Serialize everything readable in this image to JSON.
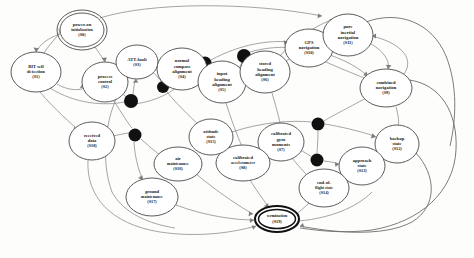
{
  "diagram": {
    "type": "state-transition-diagram",
    "title": "",
    "background_color": "#fdfdfc",
    "node_fill": "#ffffff",
    "node_stroke": "#4a4a4a",
    "edge_color": "#8e8e8e",
    "junction_color": "#111111",
    "nodes": [
      {
        "key": "s0",
        "id": "(S0)",
        "lines": [
          "power-on",
          "initialization"
        ],
        "cx": 82,
        "cy": 30,
        "rx": 25,
        "ry": 20,
        "shape": "double-ellipse"
      },
      {
        "key": "s1",
        "id": "(S1)",
        "lines": [
          "BIT self",
          "detection"
        ],
        "cx": 36,
        "cy": 72,
        "rx": 25,
        "ry": 20,
        "shape": "ellipse"
      },
      {
        "key": "s2",
        "id": "(S2)",
        "lines": [
          "process",
          "control"
        ],
        "cx": 105,
        "cy": 82,
        "rx": 23,
        "ry": 20,
        "shape": "ellipse"
      },
      {
        "key": "s3",
        "id": "(S3)",
        "lines": [
          "ATT-fault"
        ],
        "cx": 137,
        "cy": 62,
        "rx": 21,
        "ry": 17,
        "shape": "ellipse"
      },
      {
        "key": "s4",
        "id": "(S4)",
        "lines": [
          "normal",
          "compass",
          "alignment"
        ],
        "cx": 182,
        "cy": 69,
        "rx": 25,
        "ry": 21,
        "shape": "ellipse"
      },
      {
        "key": "s5",
        "id": "(S5)",
        "lines": [
          "input",
          "heading",
          "alignment"
        ],
        "cx": 222,
        "cy": 82,
        "rx": 24,
        "ry": 21,
        "shape": "ellipse"
      },
      {
        "key": "s6",
        "id": "(S6)",
        "lines": [
          "stored",
          "heading",
          "alignment"
        ],
        "cx": 265,
        "cy": 72,
        "rx": 25,
        "ry": 21,
        "shape": "ellipse"
      },
      {
        "key": "s10",
        "id": "(S10)",
        "lines": [
          "GPS",
          "navigation"
        ],
        "cx": 309,
        "cy": 48,
        "rx": 24,
        "ry": 19,
        "shape": "ellipse"
      },
      {
        "key": "s11",
        "id": "(S11)",
        "lines": [
          "pure",
          "inertial",
          "navigation"
        ],
        "cx": 348,
        "cy": 35,
        "rx": 25,
        "ry": 21,
        "shape": "ellipse"
      },
      {
        "key": "s9",
        "id": "(S9)",
        "lines": [
          "combined",
          "navigation"
        ],
        "cx": 386,
        "cy": 88,
        "rx": 26,
        "ry": 19,
        "shape": "ellipse"
      },
      {
        "key": "s12",
        "id": "(S12)",
        "lines": [
          "backup",
          "state"
        ],
        "cx": 397,
        "cy": 144,
        "rx": 22,
        "ry": 19,
        "shape": "ellipse"
      },
      {
        "key": "s13",
        "id": "(S13)",
        "lines": [
          "approach",
          "state"
        ],
        "cx": 362,
        "cy": 166,
        "rx": 23,
        "ry": 19,
        "shape": "ellipse"
      },
      {
        "key": "s14",
        "id": "(S14)",
        "lines": [
          "end-of-",
          "flight state"
        ],
        "cx": 324,
        "cy": 188,
        "rx": 25,
        "ry": 19,
        "shape": "ellipse"
      },
      {
        "key": "s7",
        "id": "(S7)",
        "lines": [
          "calibrated",
          "gyro",
          "moments"
        ],
        "cx": 281,
        "cy": 142,
        "rx": 23,
        "ry": 19,
        "shape": "ellipse"
      },
      {
        "key": "s8",
        "id": "(S8)",
        "lines": [
          "calibrated",
          "accelerometer"
        ],
        "cx": 243,
        "cy": 163,
        "rx": 27,
        "ry": 18,
        "shape": "ellipse"
      },
      {
        "key": "s15",
        "id": "(S15)",
        "lines": [
          "attitude",
          "state"
        ],
        "cx": 211,
        "cy": 137,
        "rx": 22,
        "ry": 18,
        "shape": "ellipse"
      },
      {
        "key": "s16",
        "id": "(S16)",
        "lines": [
          "air",
          "maintenance"
        ],
        "cx": 178,
        "cy": 164,
        "rx": 24,
        "ry": 17,
        "shape": "ellipse"
      },
      {
        "key": "s17",
        "id": "(S17)",
        "lines": [
          "ground",
          "maintenance"
        ],
        "cx": 152,
        "cy": 197,
        "rx": 26,
        "ry": 19,
        "shape": "ellipse"
      },
      {
        "key": "s18",
        "id": "(S18)",
        "lines": [
          "received",
          "data"
        ],
        "cx": 92,
        "cy": 141,
        "rx": 23,
        "ry": 19,
        "shape": "ellipse"
      },
      {
        "key": "s19",
        "id": "(S19)",
        "lines": [
          "termination"
        ],
        "cx": 277,
        "cy": 219,
        "rx": 22,
        "ry": 13,
        "shape": "double-ellipse-accept"
      }
    ],
    "junctions": [
      {
        "key": "j1",
        "cx": 131,
        "cy": 101,
        "r": 7
      },
      {
        "key": "j2",
        "cx": 163,
        "cy": 87,
        "r": 6
      },
      {
        "key": "j3",
        "cx": 205,
        "cy": 63,
        "r": 6.5
      },
      {
        "key": "j4",
        "cx": 244,
        "cy": 56,
        "r": 7
      },
      {
        "key": "j5",
        "cx": 135,
        "cy": 135,
        "r": 6.5
      },
      {
        "key": "j6",
        "cx": 318,
        "cy": 124,
        "r": 6.5
      },
      {
        "key": "j7",
        "cx": 317,
        "cy": 160,
        "r": 6.5
      }
    ]
  }
}
